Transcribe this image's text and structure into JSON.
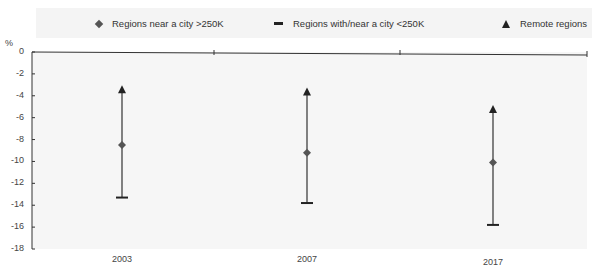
{
  "chart_data": {
    "type": "scatter",
    "subtype": "range-error-bars",
    "title": "",
    "xlabel": "",
    "ylabel": "%",
    "ylim": [
      -18,
      0
    ],
    "yticks": [
      0,
      -2,
      -4,
      -6,
      -8,
      -10,
      -12,
      -14,
      -16,
      -18
    ],
    "categories": [
      "2003",
      "2007",
      "2017"
    ],
    "series": [
      {
        "name": "Regions near a city >250K",
        "marker": "diamond",
        "values": [
          -8.5,
          -9.2,
          -10.1
        ]
      },
      {
        "name": "Regions with/near a city <250K",
        "marker": "dash",
        "values": [
          -13.3,
          -13.8,
          -15.8
        ]
      },
      {
        "name": "Remote regions",
        "marker": "triangle",
        "values": [
          -3.4,
          -3.6,
          -5.2
        ]
      }
    ],
    "legend_position": "top",
    "grid": false
  },
  "legend": {
    "items": [
      {
        "label": "Regions near a city >250K",
        "icon": "diamond-icon"
      },
      {
        "label": "Regions with/near a city <250K",
        "icon": "dash-icon"
      },
      {
        "label": "Remote regions",
        "icon": "triangle-icon"
      }
    ]
  },
  "axis": {
    "unit": "%",
    "y_tick_labels": [
      "0",
      "-2",
      "-4",
      "-6",
      "-8",
      "-10",
      "-12",
      "-14",
      "-16",
      "-18"
    ],
    "x_tick_labels": [
      "2003",
      "2007",
      "2017"
    ]
  },
  "colors": {
    "marker": "#555555",
    "line": "#333333",
    "axis": "#333333",
    "legend_bg": "#f4f4f4"
  }
}
